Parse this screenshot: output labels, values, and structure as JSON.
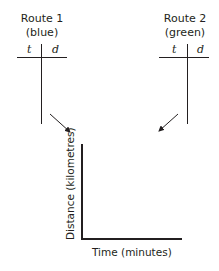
{
  "route1": {
    "title": "Route 1",
    "color_label": "(blue)",
    "columns": [
      "t",
      "d"
    ]
  },
  "route2": {
    "title": "Route 2",
    "color_label": "(green)",
    "columns": [
      "t",
      "d"
    ]
  },
  "graph": {
    "x_label": "Time (minutes)",
    "y_label": "Distance (kilometres)"
  }
}
